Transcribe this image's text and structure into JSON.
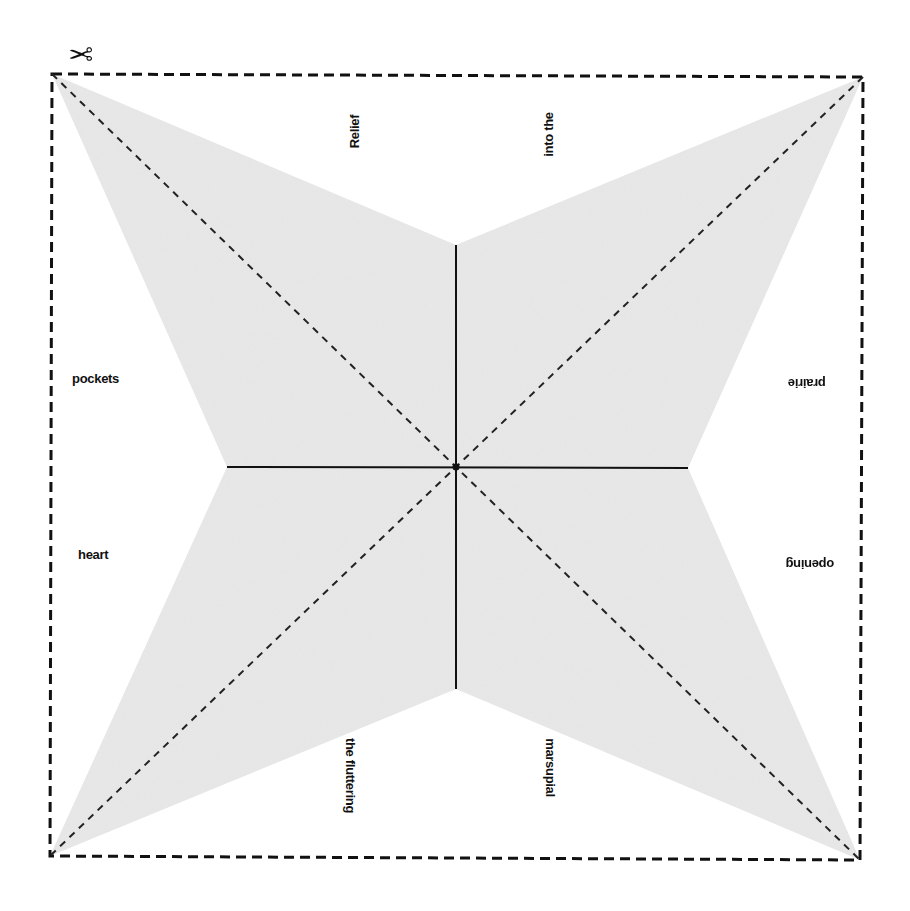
{
  "diagram": {
    "type": "fold-up fortune-teller / star cut-out template",
    "icon": "scissors-icon",
    "colors": {
      "fill": "#e9e9e9",
      "line": "#111111",
      "background": "#ffffff"
    },
    "cut_border": {
      "style": "dashed",
      "corners": {
        "top_left": [
          52,
          74
        ],
        "top_right": [
          863,
          77
        ],
        "bottom_right": [
          860,
          860
        ],
        "bottom_left": [
          50,
          856
        ]
      }
    },
    "center": [
      456,
      467
    ],
    "inner_vertices": {
      "top": [
        456,
        245
      ],
      "right": [
        688,
        468
      ],
      "bottom": [
        456,
        689
      ],
      "left": [
        227,
        467
      ]
    },
    "labels": {
      "top_left": "Relief",
      "top_right": "into the",
      "right_top": "prairie",
      "right_bottom": "opening",
      "bottom_right": "marsupial",
      "bottom_left": "the fluttering",
      "left_bottom": "heart",
      "left_top": "pockets"
    }
  }
}
